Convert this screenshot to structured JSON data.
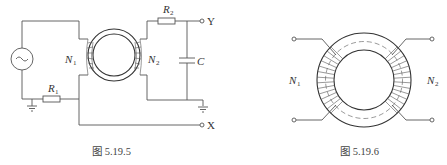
{
  "figures": [
    {
      "id": "fig-5-19-5",
      "caption": "图 5.19.5",
      "labels": {
        "r1": "R",
        "r1_sub": "1",
        "r2": "R",
        "r2_sub": "2",
        "n1": "N",
        "n1_sub": "1",
        "n2": "N",
        "n2_sub": "2",
        "c": "C",
        "y": "Y",
        "x": "X"
      },
      "components": [
        "ac-source",
        "resistor-R1",
        "toroid-transformer",
        "resistor-R2",
        "capacitor-C",
        "ground",
        "ground",
        "terminal-Y",
        "terminal-X"
      ]
    },
    {
      "id": "fig-5-19-6",
      "caption": "图 5.19.6",
      "labels": {
        "n1": "N",
        "n1_sub": "1",
        "n2": "N",
        "n2_sub": "2"
      },
      "components": [
        "toroid-core",
        "winding-N1",
        "winding-N2",
        "terminals"
      ]
    }
  ]
}
